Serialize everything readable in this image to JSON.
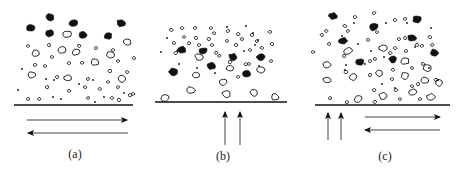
{
  "figure": {
    "colors": {
      "ink": "#111111",
      "background": "#ffffff"
    },
    "panels": [
      {
        "id": "a",
        "label": "(a)",
        "flow": [
          "horizontal-right",
          "horizontal-left"
        ],
        "baseline": {
          "x1": 14,
          "x2": 133,
          "y": 105
        },
        "arrows": [
          {
            "x1": 27,
            "y1": 120,
            "x2": 127,
            "y2": 120,
            "dir": "right"
          },
          {
            "x1": 128,
            "y1": 133,
            "x2": 28,
            "y2": 133,
            "dir": "left"
          }
        ],
        "label_pos": {
          "x": 75,
          "y": 158
        },
        "dark_particles": [
          [
            31,
            28
          ],
          [
            50,
            17
          ],
          [
            73,
            23
          ],
          [
            121,
            23
          ],
          [
            50,
            33
          ],
          [
            83,
            35
          ],
          [
            108,
            36
          ]
        ],
        "large_open": [
          [
            67,
            34
          ],
          [
            62,
            50
          ],
          [
            36,
            53
          ],
          [
            76,
            52
          ],
          [
            95,
            62
          ],
          [
            127,
            42
          ],
          [
            32,
            75
          ],
          [
            68,
            78
          ],
          [
            122,
            79
          ],
          [
            110,
            55
          ]
        ],
        "small_open": [
          [
            28,
            46
          ],
          [
            49,
            45
          ],
          [
            52,
            57
          ],
          [
            79,
            46
          ],
          [
            96,
            48
          ],
          [
            113,
            50
          ],
          [
            118,
            61
          ],
          [
            134,
            58
          ],
          [
            69,
            63
          ],
          [
            82,
            63
          ],
          [
            35,
            65
          ],
          [
            45,
            66
          ],
          [
            110,
            71
          ],
          [
            127,
            72
          ],
          [
            57,
            77
          ],
          [
            88,
            79
          ],
          [
            47,
            87
          ],
          [
            69,
            91
          ],
          [
            85,
            87
          ],
          [
            100,
            89
          ],
          [
            108,
            82
          ],
          [
            118,
            87
          ],
          [
            133,
            94
          ],
          [
            28,
            99
          ],
          [
            39,
            99
          ],
          [
            88,
            98
          ],
          [
            112,
            98
          ],
          [
            119,
            100
          ],
          [
            130,
            95
          ]
        ],
        "dots": [
          [
            22,
            69
          ],
          [
            46,
            79
          ],
          [
            79,
            84
          ],
          [
            93,
            80
          ],
          [
            18,
            90
          ],
          [
            53,
            97
          ],
          [
            61,
            99
          ],
          [
            95,
            102
          ],
          [
            104,
            97
          ],
          [
            124,
            93
          ],
          [
            54,
            80
          ]
        ]
      },
      {
        "id": "b",
        "label": "(b)",
        "flow": [
          "vertical-up",
          "vertical-up"
        ],
        "baseline": {
          "x1": 155,
          "x2": 287,
          "y": 102
        },
        "arrows": [
          {
            "x1": 225,
            "y1": 145,
            "x2": 225,
            "y2": 112,
            "dir": "up"
          },
          {
            "x1": 240,
            "y1": 145,
            "x2": 240,
            "y2": 112,
            "dir": "up"
          }
        ],
        "label_pos": {
          "x": 223,
          "y": 160
        },
        "dark_particles": [
          [
            182,
            50
          ],
          [
            203,
            51
          ],
          [
            233,
            57
          ],
          [
            261,
            57
          ],
          [
            173,
            72
          ],
          [
            211,
            66
          ],
          [
            247,
            74
          ]
        ],
        "large_open": [
          [
            199,
            57
          ],
          [
            196,
            75
          ],
          [
            230,
            68
          ],
          [
            261,
            70
          ],
          [
            223,
            82
          ],
          [
            165,
            98
          ],
          [
            191,
            90
          ],
          [
            226,
            94
          ],
          [
            254,
            93
          ],
          [
            275,
            97
          ]
        ],
        "small_open": [
          [
            171,
            30
          ],
          [
            182,
            28
          ],
          [
            195,
            28
          ],
          [
            211,
            28
          ],
          [
            227,
            41
          ],
          [
            214,
            33
          ],
          [
            184,
            37
          ],
          [
            196,
            38
          ],
          [
            174,
            43
          ],
          [
            212,
            45
          ],
          [
            228,
            31
          ],
          [
            242,
            39
          ],
          [
            257,
            41
          ],
          [
            270,
            32
          ],
          [
            176,
            53
          ],
          [
            209,
            39
          ],
          [
            236,
            45
          ],
          [
            250,
            50
          ],
          [
            262,
            48
          ],
          [
            272,
            44
          ],
          [
            216,
            53
          ],
          [
            219,
            56
          ],
          [
            249,
            64
          ],
          [
            271,
            61
          ],
          [
            230,
            62
          ],
          [
            238,
            77
          ],
          [
            246,
            64
          ],
          [
            199,
            45
          ],
          [
            189,
            43
          ],
          [
            238,
            34
          ],
          [
            252,
            35
          ]
        ],
        "dots": [
          [
            177,
            51
          ],
          [
            179,
            64
          ],
          [
            197,
            68
          ],
          [
            215,
            73
          ],
          [
            227,
            27
          ],
          [
            246,
            26
          ],
          [
            253,
            33
          ],
          [
            258,
            40
          ],
          [
            255,
            45
          ],
          [
            244,
            51
          ],
          [
            259,
            66
          ],
          [
            167,
            38
          ],
          [
            161,
            52
          ]
        ]
      },
      {
        "id": "c",
        "label": "(c)",
        "flow": [
          "vertical-up",
          "vertical-up",
          "horizontal-right",
          "horizontal-left"
        ],
        "baseline": {
          "x1": 315,
          "x2": 450,
          "y": 105
        },
        "arrows": [
          {
            "x1": 328,
            "y1": 140,
            "x2": 328,
            "y2": 113,
            "dir": "up"
          },
          {
            "x1": 341,
            "y1": 140,
            "x2": 341,
            "y2": 113,
            "dir": "up"
          },
          {
            "x1": 365,
            "y1": 117,
            "x2": 440,
            "y2": 117,
            "dir": "right"
          },
          {
            "x1": 440,
            "y1": 130,
            "x2": 365,
            "y2": 130,
            "dir": "left"
          }
        ],
        "label_pos": {
          "x": 385,
          "y": 160
        },
        "dark_particles": [
          [
            333,
            16
          ],
          [
            374,
            27
          ],
          [
            417,
            19
          ],
          [
            343,
            41
          ],
          [
            412,
            38
          ],
          [
            434,
            53
          ],
          [
            360,
            62
          ],
          [
            393,
            59
          ]
        ],
        "large_open": [
          [
            348,
            51
          ],
          [
            327,
            65
          ],
          [
            383,
            48
          ],
          [
            405,
            61
          ],
          [
            353,
            77
          ],
          [
            327,
            80
          ],
          [
            379,
            73
          ],
          [
            405,
            76
          ],
          [
            427,
            68
          ],
          [
            425,
            80
          ],
          [
            439,
            83
          ],
          [
            413,
            92
          ],
          [
            358,
            99
          ],
          [
            383,
            96
          ],
          [
            431,
            97
          ]
        ],
        "small_open": [
          [
            355,
            17
          ],
          [
            374,
            13
          ],
          [
            395,
            20
          ],
          [
            405,
            19
          ],
          [
            345,
            26
          ],
          [
            348,
            31
          ],
          [
            326,
            31
          ],
          [
            368,
            40
          ],
          [
            399,
            39
          ],
          [
            377,
            32
          ],
          [
            405,
            38
          ],
          [
            430,
            37
          ],
          [
            417,
            45
          ],
          [
            432,
            45
          ],
          [
            329,
            44
          ],
          [
            313,
            52
          ],
          [
            344,
            56
          ],
          [
            370,
            61
          ],
          [
            375,
            59
          ],
          [
            390,
            53
          ],
          [
            395,
            48
          ],
          [
            406,
            51
          ],
          [
            422,
            46
          ],
          [
            346,
            72
          ],
          [
            370,
            75
          ],
          [
            393,
            70
          ],
          [
            392,
            79
          ],
          [
            412,
            68
          ],
          [
            423,
            64
          ],
          [
            374,
            90
          ],
          [
            396,
            90
          ],
          [
            412,
            86
          ],
          [
            418,
            84
          ],
          [
            436,
            80
          ],
          [
            330,
            98
          ],
          [
            347,
            102
          ],
          [
            375,
            102
          ],
          [
            400,
            99
          ],
          [
            420,
            99
          ],
          [
            322,
            35
          ]
        ],
        "dots": [
          [
            342,
            36
          ],
          [
            354,
            23
          ],
          [
            386,
            23
          ],
          [
            407,
            23
          ],
          [
            431,
            28
          ],
          [
            358,
            44
          ],
          [
            371,
            51
          ],
          [
            384,
            57
          ],
          [
            415,
            47
          ],
          [
            345,
            70
          ],
          [
            346,
            65
          ],
          [
            365,
            64
          ],
          [
            382,
            84
          ],
          [
            395,
            88
          ],
          [
            429,
            68
          ],
          [
            438,
            80
          ]
        ]
      }
    ]
  }
}
